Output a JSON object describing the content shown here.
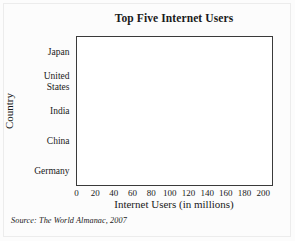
{
  "figure": {
    "source_note": "Source: The World Almanac, 2007"
  },
  "chart_data": {
    "type": "bar",
    "orientation": "horizontal",
    "title": "Top Five Internet Users",
    "xlabel": "Internet Users (in millions)",
    "ylabel": "Country",
    "categories": [
      "Japan",
      "United States",
      "India",
      "China",
      "Germany"
    ],
    "category_lines": [
      [
        "Japan"
      ],
      [
        "United",
        "States"
      ],
      [
        "India"
      ],
      [
        "China"
      ],
      [
        "Germany"
      ]
    ],
    "values": [
      86,
      197,
      50,
      120,
      46
    ],
    "xlim": [
      0,
      210
    ],
    "xticks": [
      0,
      20,
      40,
      60,
      80,
      100,
      120,
      140,
      160,
      180,
      200
    ],
    "xtick_labels": [
      "0",
      "20",
      "40",
      "60",
      "80",
      "100",
      "120",
      "140",
      "160",
      "180",
      "200"
    ],
    "grid": "vertical",
    "legend": "none",
    "bar_color": "#a9a9a9",
    "bar_edge_color": "#8a8a8a",
    "axis_color": "#3a3a3a",
    "gridline_color": "#b9b9b9",
    "plot_background": "#ffffff"
  }
}
